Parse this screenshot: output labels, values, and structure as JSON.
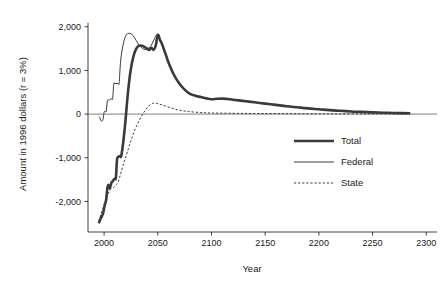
{
  "chart_data": {
    "type": "line",
    "title": "",
    "xlabel": "Year",
    "ylabel": "Amount in 1996 dollars (r = 3%)",
    "xlim": [
      1985,
      2310
    ],
    "ylim": [
      -2700,
      2200
    ],
    "grid": false,
    "legend_position": "right-middle",
    "xticks": [
      "2000",
      "2050",
      "2100",
      "2150",
      "2200",
      "2250",
      "2300"
    ],
    "xtick_values": [
      2000,
      2050,
      2100,
      2150,
      2200,
      2250,
      2300
    ],
    "yticks": [
      "2,000",
      "1,000",
      "0",
      "-1,000",
      "-2,000"
    ],
    "ytick_values": [
      2000,
      1000,
      0,
      -1000,
      -2000
    ],
    "zero_reference_line": 0,
    "series": [
      {
        "name": "Total",
        "style": "thick-solid",
        "color": "#3a3a3a",
        "x": [
          1995,
          1997,
          1999,
          2000,
          2001,
          2002,
          2003,
          2004,
          2005,
          2006,
          2007,
          2008,
          2009,
          2010,
          2011,
          2012,
          2013,
          2014,
          2015,
          2016,
          2018,
          2020,
          2022,
          2024,
          2026,
          2028,
          2030,
          2032,
          2034,
          2036,
          2038,
          2040,
          2042,
          2044,
          2046,
          2048,
          2050,
          2052,
          2054,
          2056,
          2058,
          2060,
          2065,
          2070,
          2075,
          2080,
          2085,
          2090,
          2095,
          2100,
          2105,
          2110,
          2115,
          2120,
          2130,
          2140,
          2150,
          2160,
          2170,
          2180,
          2190,
          2200,
          2210,
          2220,
          2230,
          2240,
          2250,
          2260,
          2270,
          2285
        ],
        "y": [
          -2500,
          -2380,
          -2280,
          -2150,
          -2050,
          -1950,
          -1700,
          -1620,
          -1700,
          -1640,
          -1560,
          -1540,
          -1500,
          -1480,
          -1450,
          -1050,
          -980,
          -970,
          -960,
          -955,
          -600,
          -120,
          440,
          880,
          1180,
          1380,
          1500,
          1560,
          1570,
          1560,
          1530,
          1500,
          1470,
          1520,
          1470,
          1560,
          1810,
          1700,
          1600,
          1460,
          1320,
          1180,
          900,
          700,
          560,
          460,
          420,
          390,
          360,
          340,
          350,
          355,
          345,
          330,
          300,
          270,
          240,
          210,
          180,
          155,
          130,
          110,
          90,
          75,
          60,
          50,
          40,
          32,
          25,
          18
        ]
      },
      {
        "name": "Federal",
        "style": "thin-solid",
        "color": "#3a3a3a",
        "x": [
          1995,
          1996,
          1997,
          1998,
          1999,
          2000,
          2001,
          2002,
          2003,
          2004,
          2005,
          2006,
          2007,
          2008,
          2009,
          2010,
          2011,
          2012,
          2013,
          2014,
          2015,
          2016,
          2018,
          2020,
          2022,
          2024,
          2026,
          2028,
          2030,
          2032,
          2034,
          2036,
          2038,
          2040,
          2042,
          2044,
          2046,
          2048,
          2050,
          2052,
          2054,
          2056,
          2058,
          2060,
          2065,
          2070,
          2075,
          2080,
          2085,
          2090,
          2095,
          2100,
          2105,
          2110,
          2115,
          2120,
          2130,
          2140,
          2150,
          2160,
          2170,
          2180,
          2190,
          2200,
          2210,
          2220,
          2230,
          2240,
          2250,
          2260,
          2270,
          2285
        ],
        "y": [
          -60,
          -80,
          -150,
          -160,
          -120,
          40,
          60,
          70,
          300,
          320,
          330,
          340,
          350,
          360,
          690,
          700,
          700,
          700,
          700,
          710,
          1100,
          1350,
          1620,
          1790,
          1840,
          1850,
          1820,
          1760,
          1680,
          1600,
          1540,
          1500,
          1480,
          1490,
          1520,
          1580,
          1680,
          1780,
          1830,
          1720,
          1610,
          1470,
          1330,
          1190,
          910,
          710,
          570,
          470,
          425,
          395,
          365,
          345,
          352,
          356,
          346,
          331,
          301,
          271,
          241,
          211,
          181,
          156,
          131,
          111,
          91,
          76,
          61,
          51,
          41,
          33,
          26,
          19
        ]
      },
      {
        "name": "State",
        "style": "dashed",
        "color": "#3a3a3a",
        "x": [
          1995,
          1997,
          1999,
          2001,
          2003,
          2005,
          2007,
          2009,
          2011,
          2013,
          2015,
          2017,
          2019,
          2021,
          2023,
          2025,
          2027,
          2029,
          2031,
          2033,
          2035,
          2037,
          2039,
          2041,
          2043,
          2045,
          2047,
          2050,
          2055,
          2060,
          2065,
          2070,
          2075,
          2080,
          2090,
          2100,
          2120,
          2140,
          2160,
          2180,
          2200,
          2230,
          2260,
          2285
        ],
        "y": [
          -2450,
          -2300,
          -2150,
          -2000,
          -1880,
          -1760,
          -1700,
          -1680,
          -1620,
          -1560,
          -1400,
          -1230,
          -1070,
          -920,
          -760,
          -610,
          -470,
          -340,
          -230,
          -130,
          -40,
          40,
          110,
          170,
          215,
          245,
          250,
          240,
          200,
          160,
          120,
          90,
          70,
          55,
          35,
          25,
          18,
          14,
          11,
          9,
          7,
          5,
          4,
          3
        ]
      }
    ]
  },
  "legend": {
    "items": [
      {
        "label": "Total",
        "style": "thick-solid"
      },
      {
        "label": "Federal",
        "style": "thin-solid"
      },
      {
        "label": "State",
        "style": "dashed"
      }
    ]
  }
}
